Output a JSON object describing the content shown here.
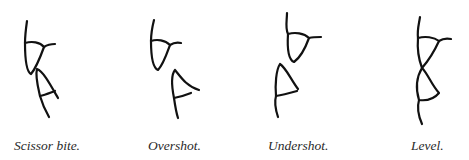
{
  "figures": [
    {
      "id": "scissor",
      "caption": "Scissor bite."
    },
    {
      "id": "overshot",
      "caption": "Overshot."
    },
    {
      "id": "undershot",
      "caption": "Undershot."
    },
    {
      "id": "level",
      "caption": "Level."
    }
  ],
  "colors": {
    "line": "#111111",
    "caption": "#2a2a2a",
    "background": "#ffffff"
  }
}
